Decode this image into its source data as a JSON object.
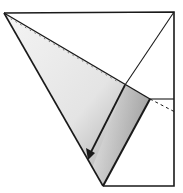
{
  "diagram": {
    "type": "origami-fold-step",
    "colors": {
      "line": "#1a1a1a",
      "paper": "#ffffff",
      "shade_light": "#eeeeee",
      "shade_dark": "#a8a8a8"
    },
    "elements": {
      "square_outline": "square-paper",
      "fold_line": "dashed-valley-fold-line",
      "flap": "shaded-folded-flap",
      "arrow": "fold-direction-arrow"
    }
  }
}
